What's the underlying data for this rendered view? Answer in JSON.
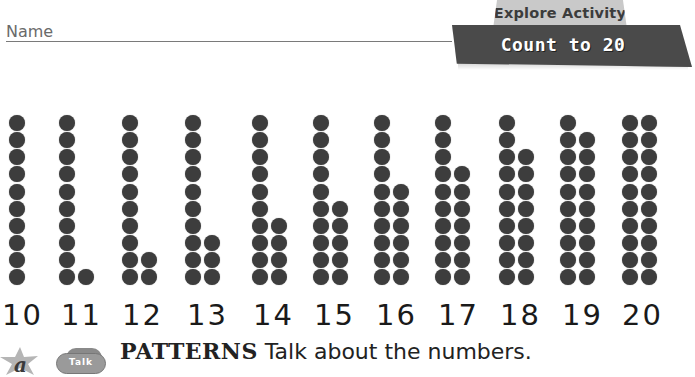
{
  "header": {
    "name_label": "Name",
    "banner_tab": "Explore Activity",
    "banner_title": "Count to 20"
  },
  "dot_columns": [
    {
      "number": "10",
      "left_column": 10,
      "right_column": 0
    },
    {
      "number": "11",
      "left_column": 10,
      "right_column": 1
    },
    {
      "number": "12",
      "left_column": 10,
      "right_column": 2
    },
    {
      "number": "13",
      "left_column": 10,
      "right_column": 3
    },
    {
      "number": "14",
      "left_column": 10,
      "right_column": 4
    },
    {
      "number": "15",
      "left_column": 10,
      "right_column": 5
    },
    {
      "number": "16",
      "left_column": 10,
      "right_column": 6
    },
    {
      "number": "17",
      "left_column": 10,
      "right_column": 7
    },
    {
      "number": "18",
      "left_column": 10,
      "right_column": 8
    },
    {
      "number": "19",
      "left_column": 10,
      "right_column": 9
    },
    {
      "number": "20",
      "left_column": 10,
      "right_column": 10
    }
  ],
  "numbers": [
    "10",
    "11",
    "12",
    "13",
    "14",
    "15",
    "16",
    "17",
    "18",
    "19",
    "20"
  ],
  "footer": {
    "algebra_icon": "a",
    "talk_icon_label": "Talk",
    "keyword": "PATTERNS",
    "instruction": " Talk about the numbers."
  },
  "colors": {
    "dot": "#3d3d3d",
    "banner_dark": "#4a4a4a",
    "banner_tab": "#c9c9c9"
  }
}
